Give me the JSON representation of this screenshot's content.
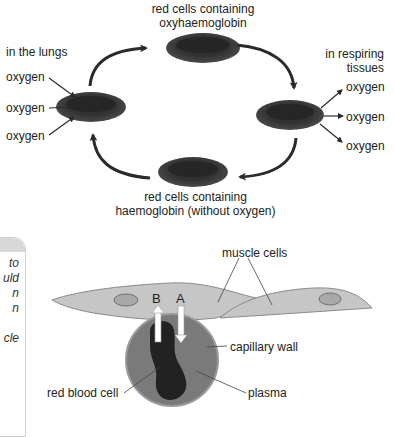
{
  "top_diagram": {
    "top_label": [
      "red cells containing",
      "oxyhaemoglobin"
    ],
    "bottom_label": [
      "red cells containing",
      "haemoglobin (without oxygen)"
    ],
    "left_label": "in the lungs",
    "right_label": [
      "in respiring",
      "tissues"
    ],
    "left_oxygen": [
      "oxygen",
      "oxygen",
      "oxygen"
    ],
    "right_oxygen": [
      "oxygen",
      "oxygen",
      "oxygen"
    ]
  },
  "side_box": {
    "lines": [
      "to",
      "uld",
      "n",
      "n",
      "",
      "cle"
    ]
  },
  "bottom_diagram": {
    "muscle_cells": "muscle cells",
    "capillary_wall": "capillary wall",
    "red_blood_cell": "red blood cell",
    "plasma": "plasma",
    "arrow_b": "B",
    "arrow_a": "A"
  },
  "colors": {
    "red_cell": "#3a3a3a",
    "muscle_cell": "#c6c6c6",
    "nucleus": "#a9a9a9",
    "capillary": "#7a7a7a",
    "rbc_dark": "#222222"
  }
}
